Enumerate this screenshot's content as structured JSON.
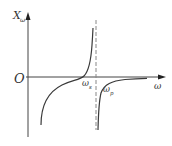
{
  "diagram": {
    "type": "reactance-frequency-curve",
    "y_axis_label": "X",
    "y_axis_subscript": "ω",
    "x_axis_label": "ω",
    "origin_label": "O",
    "series_resonance_label": "ω",
    "series_resonance_subscript": "s",
    "parallel_resonance_label": "ω",
    "parallel_resonance_subscript": "p",
    "colors": {
      "axis": "#444444",
      "curve": "#3a3a3a",
      "dashed_asymptote": "#888888",
      "text": "#333333"
    }
  }
}
